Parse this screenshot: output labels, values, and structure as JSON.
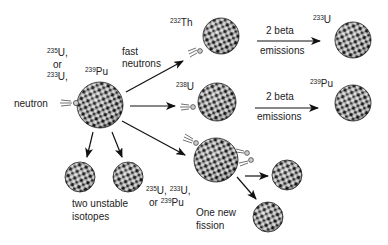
{
  "diagram": {
    "type": "nuclear-fission-breeding",
    "labels": {
      "incoming_particle": "neutron",
      "fissile_options": {
        "line1_mass": "235",
        "line1_el": "U,",
        "line2": "or",
        "line3_mass": "233",
        "line3_el": "U,"
      },
      "target": {
        "mass": "239",
        "el": "Pu"
      },
      "fast_neutrons_1": "fast",
      "fast_neutrons_2": "neutrons",
      "th232": {
        "mass": "232",
        "el": "Th"
      },
      "u238": {
        "mass": "238",
        "el": "U"
      },
      "u233": {
        "mass": "233",
        "el": "U"
      },
      "pu239": {
        "mass": "239",
        "el": "Pu"
      },
      "beta_top_1": "2 beta",
      "beta_top_2": "emissions",
      "beta_bot_1": "2 beta",
      "beta_bot_2": "emissions",
      "unstable_1": "two unstable",
      "unstable_2": "isotopes",
      "fissile_new": {
        "a_mass": "235",
        "a_el": "U, ",
        "b_mass": "233",
        "b_el": "U,",
        "c_pre": "or ",
        "c_mass": "239",
        "c_el": "Pu"
      },
      "new_fission_1": "One new",
      "new_fission_2": "fission"
    },
    "nuclei": [
      {
        "name": "main-nucleus",
        "cx": 100,
        "cy": 105,
        "r": 23
      },
      {
        "name": "th232-nucleus",
        "cx": 221,
        "cy": 36,
        "r": 18
      },
      {
        "name": "u233-nucleus",
        "cx": 353,
        "cy": 40,
        "r": 18
      },
      {
        "name": "u238-nucleus",
        "cx": 217,
        "cy": 102,
        "r": 19
      },
      {
        "name": "pu239-nucleus",
        "cx": 353,
        "cy": 103,
        "r": 18
      },
      {
        "name": "unstable-isotope-1",
        "cx": 80,
        "cy": 177,
        "r": 15
      },
      {
        "name": "unstable-isotope-2",
        "cx": 128,
        "cy": 177,
        "r": 15
      },
      {
        "name": "new-fission-nucleus",
        "cx": 216,
        "cy": 160,
        "r": 22
      },
      {
        "name": "fission-fragment-1",
        "cx": 287,
        "cy": 175,
        "r": 15
      },
      {
        "name": "fission-fragment-2",
        "cx": 268,
        "cy": 217,
        "r": 15
      }
    ],
    "colors": {
      "ink": "#111111",
      "stipple": "#9a9a9a",
      "background": "#ffffff"
    }
  }
}
